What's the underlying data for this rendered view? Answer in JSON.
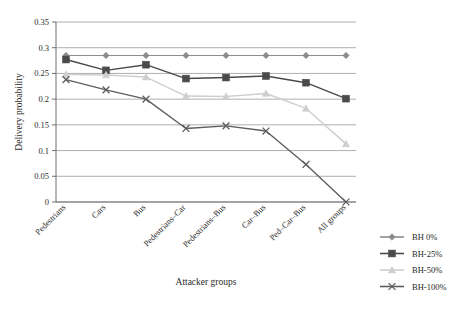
{
  "chart_data": {
    "type": "line",
    "title": "",
    "xlabel": "Attacker groups",
    "ylabel": "Delivery probability",
    "ylim": [
      0,
      0.35
    ],
    "ytick_labels": [
      "0",
      "0.05",
      "0.1",
      "0.15",
      "0.2",
      "0.25",
      "0.3",
      "0.35"
    ],
    "ytick_values": [
      0,
      0.05,
      0.1,
      0.15,
      0.2,
      0.25,
      0.3,
      0.35
    ],
    "grid": "horizontal",
    "legend_position": "right",
    "categories": [
      "Pedestrians",
      "Cars",
      "Bus",
      "Pedestrians–Car",
      "Pedestrians–Bus",
      "Car–Bus",
      "Ped–Car–Bus",
      "All groups"
    ],
    "series": [
      {
        "name": "BH 0%",
        "marker": "diamond",
        "color": "#8c8c8c",
        "values": [
          0.285,
          0.285,
          0.285,
          0.285,
          0.285,
          0.285,
          0.285,
          0.285
        ]
      },
      {
        "name": "BH-25%",
        "marker": "square",
        "color": "#4a4a4a",
        "values": [
          0.277,
          0.256,
          0.267,
          0.24,
          0.242,
          0.245,
          0.232,
          0.201
        ]
      },
      {
        "name": "BH-50%",
        "marker": "triangle",
        "color": "#cfcfcf",
        "values": [
          0.248,
          0.247,
          0.243,
          0.206,
          0.205,
          0.211,
          0.182,
          0.113
        ]
      },
      {
        "name": "BH-100%",
        "marker": "x",
        "color": "#5e5e5e",
        "values": [
          0.238,
          0.218,
          0.2,
          0.143,
          0.148,
          0.138,
          0.073,
          0.0
        ]
      }
    ]
  },
  "legend": {
    "items": [
      {
        "label": "BH 0%"
      },
      {
        "label": "BH-25%"
      },
      {
        "label": "BH-50%"
      },
      {
        "label": "BH-100%"
      }
    ]
  }
}
